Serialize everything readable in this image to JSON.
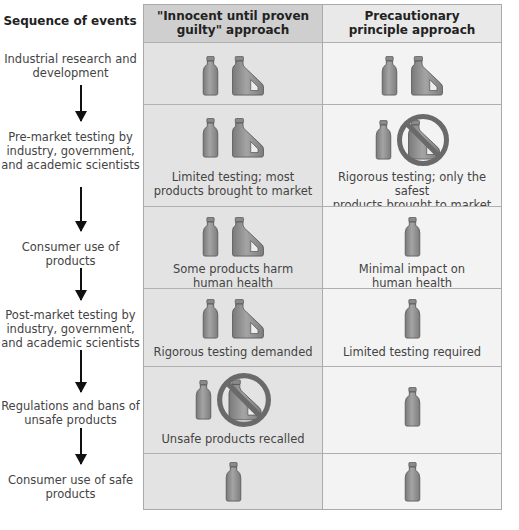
{
  "sequence": {
    "heading": "Sequence of events",
    "steps": [
      {
        "label": "Industrial research and development"
      },
      {
        "label": "Pre-market testing by industry, government, and academic scientists"
      },
      {
        "label": "Consumer use of products"
      },
      {
        "label": "Post-market testing by industry, government, and academic scientists"
      },
      {
        "label": "Regulations and bans of unsafe products"
      },
      {
        "label": "Consumer use of safe products"
      }
    ]
  },
  "columns": {
    "innocent": {
      "title_line1": "\"Innocent until proven",
      "title_line2": "guilty\" approach",
      "rows": [
        {
          "icons": [
            "bottle-icon",
            "jug-icon"
          ],
          "caption": ""
        },
        {
          "icons": [
            "bottle-icon",
            "jug-icon"
          ],
          "caption_line1": "Limited testing; most",
          "caption_line2": "products brought to market"
        },
        {
          "icons": [
            "bottle-icon",
            "jug-icon"
          ],
          "caption_line1": "Some products harm",
          "caption_line2": "human health"
        },
        {
          "icons": [
            "bottle-icon",
            "jug-icon"
          ],
          "caption_line1": "Rigorous testing demanded",
          "caption_line2": ""
        },
        {
          "icons": [
            "bottle-icon",
            "banned-jug-icon"
          ],
          "caption_line1": "Unsafe products recalled",
          "caption_line2": ""
        },
        {
          "icons": [
            "bottle-icon"
          ],
          "caption": ""
        }
      ]
    },
    "precautionary": {
      "title_line1": "Precautionary",
      "title_line2": "principle approach",
      "rows": [
        {
          "icons": [
            "bottle-icon",
            "jug-icon"
          ],
          "caption": ""
        },
        {
          "icons": [
            "bottle-icon",
            "banned-jug-icon"
          ],
          "caption_line1": "Rigorous testing; only the safest",
          "caption_line2": "products brought to market"
        },
        {
          "icons": [
            "bottle-icon"
          ],
          "caption_line1": "Minimal impact on",
          "caption_line2": "human health"
        },
        {
          "icons": [
            "bottle-icon"
          ],
          "caption_line1": "Limited testing required",
          "caption_line2": ""
        },
        {
          "icons": [
            "bottle-icon"
          ],
          "caption": ""
        },
        {
          "icons": [
            "bottle-icon"
          ],
          "caption": ""
        }
      ]
    }
  },
  "colors": {
    "header_left": "#cfcfcf",
    "header_right": "#e9e9e9",
    "cell_left": "#e3e3e3",
    "cell_right": "#f3f3f3",
    "icon_fill": "#8c8c8c",
    "ban_ring": "#6a6a6a"
  }
}
